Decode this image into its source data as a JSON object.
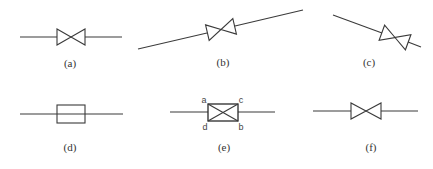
{
  "figure": {
    "panels": [
      {
        "id": "a",
        "caption": "(a)",
        "symbol": "gate-valve-horizontal"
      },
      {
        "id": "b",
        "caption": "(b)",
        "symbol": "gate-valve-inclined-up"
      },
      {
        "id": "c",
        "caption": "(c)",
        "symbol": "gate-valve-inclined-down"
      },
      {
        "id": "d",
        "caption": "(d)",
        "symbol": "rectangle-on-line"
      },
      {
        "id": "e",
        "caption": "(e)",
        "symbol": "crossed-rectangle-on-line",
        "corner_labels": {
          "top_left": "a",
          "top_right": "c",
          "bottom_left": "d",
          "bottom_right": "b"
        }
      },
      {
        "id": "f",
        "caption": "(f)",
        "symbol": "gate-valve-horizontal"
      }
    ]
  }
}
